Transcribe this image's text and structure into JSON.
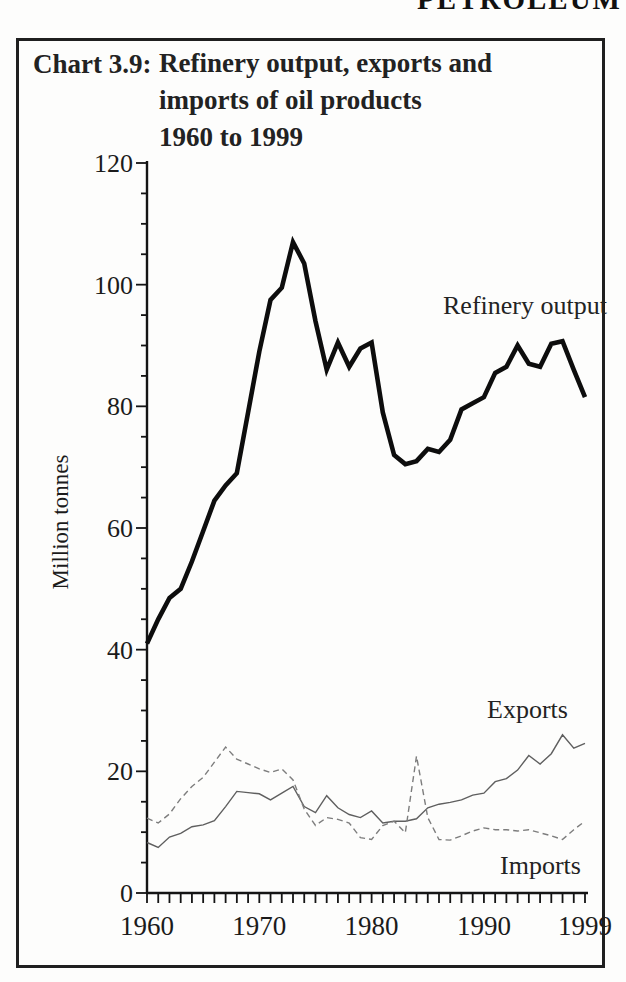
{
  "page": {
    "banner": "PETROLEUM"
  },
  "chart": {
    "label": "Chart 3.9:",
    "title_lines": [
      "Refinery output, exports and",
      "imports of oil products",
      "1960 to 1999"
    ],
    "y_axis_label": "Million tonnes"
  },
  "chart_data": {
    "type": "line",
    "title": "Refinery output, exports and imports of oil products 1960 to 1999",
    "ylabel": "Million tonnes",
    "ylim": [
      0,
      120
    ],
    "y_major_ticks": [
      0,
      20,
      40,
      60,
      80,
      100,
      120
    ],
    "y_minor_step": 5,
    "grid": false,
    "x_range": [
      1960,
      1999
    ],
    "x_minor_step": 1,
    "x_tick_labels": [
      "1960",
      "1970",
      "1980",
      "1990",
      "1999"
    ],
    "x_tick_years": [
      1960,
      1970,
      1980,
      1990,
      1999
    ],
    "x": [
      1960,
      1961,
      1962,
      1963,
      1964,
      1965,
      1966,
      1967,
      1968,
      1969,
      1970,
      1971,
      1972,
      1973,
      1974,
      1975,
      1976,
      1977,
      1978,
      1979,
      1980,
      1981,
      1982,
      1983,
      1984,
      1985,
      1986,
      1987,
      1988,
      1989,
      1990,
      1991,
      1992,
      1993,
      1994,
      1995,
      1996,
      1997,
      1998,
      1999
    ],
    "series": [
      {
        "name": "Refinery output",
        "style": "thick-solid",
        "color": "#0d0d0d",
        "values": [
          41,
          45,
          48.5,
          50,
          54.5,
          59.5,
          64.5,
          67,
          69,
          79,
          89,
          97.5,
          99.5,
          107,
          103.5,
          94,
          86,
          90.5,
          86.5,
          89.5,
          90.5,
          79,
          72,
          70.5,
          71,
          73,
          72.5,
          74.5,
          79.5,
          80.5,
          81.5,
          85.5,
          86.5,
          90,
          87,
          86.5,
          90.3,
          90.7,
          86,
          81.5
        ]
      },
      {
        "name": "Exports",
        "style": "thin-solid",
        "color": "#5f5f5f",
        "values": [
          8.3,
          7.5,
          9.2,
          9.8,
          10.9,
          11.2,
          11.9,
          14.2,
          16.7,
          16.5,
          16.3,
          15.3,
          16.4,
          17.5,
          14.2,
          13.2,
          16,
          14,
          12.9,
          12.4,
          13.5,
          11.5,
          11.8,
          11.8,
          12.2,
          14,
          14.6,
          14.9,
          15.3,
          16.1,
          16.4,
          18.3,
          18.8,
          20.2,
          22.6,
          21.2,
          22.9,
          26,
          23.8,
          24.6
        ]
      },
      {
        "name": "Imports",
        "style": "thin-dashed",
        "color": "#7d7d7d",
        "values": [
          12.3,
          11.5,
          13,
          15.5,
          17.5,
          19,
          21.5,
          24,
          22,
          21.2,
          20.4,
          19.8,
          20.4,
          18.6,
          13.8,
          11.1,
          12.4,
          12.1,
          11.5,
          9.1,
          8.8,
          11.1,
          11.8,
          9.9,
          22.5,
          12.4,
          8.8,
          8.7,
          9.4,
          10.2,
          10.7,
          10.4,
          10.4,
          10.2,
          10.4,
          9.9,
          9.4,
          8.8,
          10.4,
          11.8
        ]
      }
    ]
  }
}
